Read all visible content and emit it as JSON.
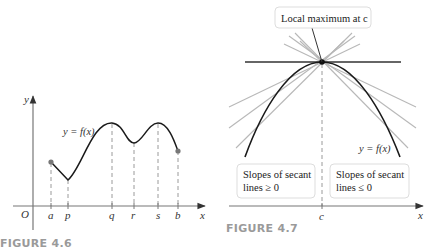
{
  "figure_4_6": {
    "caption": "FIGURE 4.6",
    "axis_y_label": "y",
    "axis_x_label": "x",
    "origin_label": "O",
    "tick_labels": [
      "a",
      "p",
      "q",
      "r",
      "s",
      "b"
    ],
    "curve_label": "y = f(x)"
  },
  "figure_4_7": {
    "caption": "FIGURE 4.7",
    "callout": "Local maximum at c",
    "curve_label": "y = f(x)",
    "left_box_line1": "Slopes of secant",
    "left_box_line2": "lines ≥ 0",
    "right_box_line1": "Slopes of secant",
    "right_box_line2": "lines ≤ 0",
    "tick_label": "c",
    "axis_x_label": "x"
  },
  "colors": {
    "curve": "#1a1a1a",
    "secant": "#b8b8b8",
    "axis": "#555555",
    "dashed": "#9a9a9a",
    "caption": "#9a9a9a",
    "point": "#777777",
    "box_border": "#dddddd"
  }
}
